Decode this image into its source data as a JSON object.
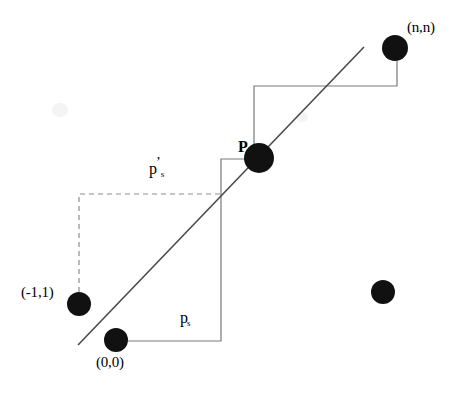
{
  "figure": {
    "width": 467,
    "height": 395,
    "background_color": "#ffffff",
    "line_color": "#6e6e6e",
    "stroke_color": "#000000",
    "dot_color": "#111111"
  },
  "labels": {
    "origin": "(0,0)",
    "minus_one_one": "(-1,1)",
    "n_n": "(n,n)",
    "p_point": "P",
    "ps_base": "p",
    "ps_sub": "s",
    "ps_prime_base": "p",
    "ps_prime_sub": "s",
    "ps_prime_sup": "’"
  },
  "nodes": [
    {
      "name": "origin-node",
      "label": "(0,0)",
      "cx": 116,
      "cy": 340,
      "r": 12
    },
    {
      "name": "minus-one-one-node",
      "label": "(-1,1)",
      "cx": 79,
      "cy": 304,
      "r": 12
    },
    {
      "name": "p-node",
      "label": "P",
      "cx": 259,
      "cy": 158,
      "r": 15
    },
    {
      "name": "n-n-node",
      "label": "(n,n)",
      "cx": 395,
      "cy": 48,
      "r": 13
    },
    {
      "name": "unlabeled-node",
      "label": "",
      "cx": 383,
      "cy": 292,
      "r": 12
    }
  ],
  "diagonal_line": {
    "x1": 78,
    "y1": 345,
    "x2": 364,
    "y2": 47
  },
  "solid_staircase_path": "M 128 341 L 221 341 L 221 159 L 254 159 L 254 86 L 397 86 L 397 61",
  "dashed_staircase_path": "M 79 292 L 79 194 L 221 194"
}
